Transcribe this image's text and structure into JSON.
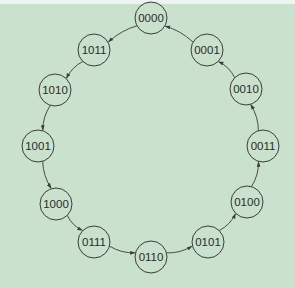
{
  "diagram": {
    "type": "state-cycle",
    "direction": "counterclockwise",
    "colors": {
      "background": "#c9e1cd",
      "stroke": "#3a3d3a",
      "text": "#2a2a2a"
    },
    "nodes": [
      {
        "id": "n0",
        "label": "0000",
        "x": 151,
        "y": 18
      },
      {
        "id": "n1",
        "label": "0001",
        "x": 207,
        "y": 50
      },
      {
        "id": "n2",
        "label": "0010",
        "x": 246,
        "y": 89
      },
      {
        "id": "n3",
        "label": "0011",
        "x": 263,
        "y": 146
      },
      {
        "id": "n4",
        "label": "0100",
        "x": 247,
        "y": 202
      },
      {
        "id": "n5",
        "label": "0101",
        "x": 208,
        "y": 242
      },
      {
        "id": "n6",
        "label": "0110",
        "x": 151,
        "y": 257
      },
      {
        "id": "n7",
        "label": "0111",
        "x": 94,
        "y": 242
      },
      {
        "id": "n8",
        "label": "1000",
        "x": 56,
        "y": 204
      },
      {
        "id": "n9",
        "label": "1001",
        "x": 38,
        "y": 146
      },
      {
        "id": "n10",
        "label": "1010",
        "x": 55,
        "y": 90
      },
      {
        "id": "n11",
        "label": "1011",
        "x": 94,
        "y": 50
      }
    ],
    "edges": [
      {
        "from": "0000",
        "to": "1011"
      },
      {
        "from": "1011",
        "to": "1010"
      },
      {
        "from": "1010",
        "to": "1001"
      },
      {
        "from": "1001",
        "to": "1000"
      },
      {
        "from": "1000",
        "to": "0111"
      },
      {
        "from": "0111",
        "to": "0110"
      },
      {
        "from": "0110",
        "to": "0101"
      },
      {
        "from": "0101",
        "to": "0100"
      },
      {
        "from": "0100",
        "to": "0011"
      },
      {
        "from": "0011",
        "to": "0010"
      },
      {
        "from": "0010",
        "to": "0001"
      },
      {
        "from": "0001",
        "to": "0000"
      }
    ]
  }
}
